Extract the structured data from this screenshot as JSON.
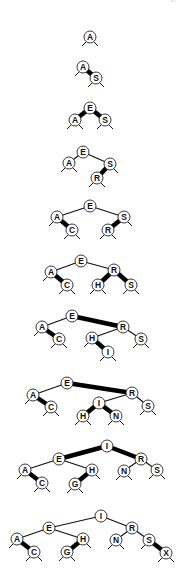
{
  "page_number": "37",
  "style": {
    "node_fill": "#ffffff",
    "node_stroke": "#222222",
    "black_link_color": "#111111",
    "red_link_color": "#000000",
    "black_link_width": 1.2,
    "red_link_width": 4.5,
    "node_radius": 6
  },
  "caption": "Red-black BST construction trace: inserting A S E R C H I N G X",
  "trees": [
    {
      "step": 1,
      "inserted": "A",
      "nodes": [
        {
          "k": "A",
          "x": 90,
          "y": 37
        }
      ],
      "links": []
    },
    {
      "step": 2,
      "inserted": "S",
      "nodes": [
        {
          "k": "A",
          "x": 83,
          "y": 67
        },
        {
          "k": "S",
          "x": 96,
          "y": 78
        }
      ],
      "links": [
        {
          "from": "A",
          "to": "S",
          "red": true
        }
      ]
    },
    {
      "step": 3,
      "inserted": "E",
      "nodes": [
        {
          "k": "E",
          "x": 90,
          "y": 108
        },
        {
          "k": "A",
          "x": 75,
          "y": 120
        },
        {
          "k": "S",
          "x": 105,
          "y": 120
        }
      ],
      "links": [
        {
          "from": "E",
          "to": "A",
          "red": true
        },
        {
          "from": "E",
          "to": "S",
          "red": true
        }
      ]
    },
    {
      "step": 4,
      "inserted": "R",
      "nodes": [
        {
          "k": "E",
          "x": 83,
          "y": 152
        },
        {
          "k": "A",
          "x": 69,
          "y": 163
        },
        {
          "k": "S",
          "x": 110,
          "y": 164
        },
        {
          "k": "R",
          "x": 97,
          "y": 178
        }
      ],
      "links": [
        {
          "from": "E",
          "to": "A",
          "red": false
        },
        {
          "from": "E",
          "to": "S",
          "red": false
        },
        {
          "from": "S",
          "to": "R",
          "red": true
        }
      ]
    },
    {
      "step": 5,
      "inserted": "C",
      "nodes": [
        {
          "k": "E",
          "x": 90,
          "y": 206
        },
        {
          "k": "A",
          "x": 57,
          "y": 217
        },
        {
          "k": "C",
          "x": 72,
          "y": 230
        },
        {
          "k": "S",
          "x": 124,
          "y": 217
        },
        {
          "k": "R",
          "x": 108,
          "y": 230
        }
      ],
      "links": [
        {
          "from": "E",
          "to": "A",
          "red": false
        },
        {
          "from": "E",
          "to": "S",
          "red": false
        },
        {
          "from": "A",
          "to": "C",
          "red": true
        },
        {
          "from": "S",
          "to": "R",
          "red": true
        }
      ]
    },
    {
      "step": 6,
      "inserted": "H",
      "nodes": [
        {
          "k": "E",
          "x": 81,
          "y": 261
        },
        {
          "k": "A",
          "x": 51,
          "y": 272
        },
        {
          "k": "C",
          "x": 67,
          "y": 285
        },
        {
          "k": "R",
          "x": 114,
          "y": 270
        },
        {
          "k": "H",
          "x": 98,
          "y": 285
        },
        {
          "k": "S",
          "x": 131,
          "y": 285
        }
      ],
      "links": [
        {
          "from": "E",
          "to": "A",
          "red": false
        },
        {
          "from": "E",
          "to": "R",
          "red": false
        },
        {
          "from": "A",
          "to": "C",
          "red": true
        },
        {
          "from": "R",
          "to": "H",
          "red": true
        },
        {
          "from": "R",
          "to": "S",
          "red": true
        }
      ]
    },
    {
      "step": 7,
      "inserted": "I",
      "nodes": [
        {
          "k": "E",
          "x": 72,
          "y": 316
        },
        {
          "k": "A",
          "x": 42,
          "y": 327
        },
        {
          "k": "C",
          "x": 59,
          "y": 339
        },
        {
          "k": "R",
          "x": 123,
          "y": 327
        },
        {
          "k": "H",
          "x": 92,
          "y": 338
        },
        {
          "k": "I",
          "x": 108,
          "y": 352
        },
        {
          "k": "S",
          "x": 141,
          "y": 339
        }
      ],
      "links": [
        {
          "from": "E",
          "to": "A",
          "red": false
        },
        {
          "from": "E",
          "to": "R",
          "red": true
        },
        {
          "from": "A",
          "to": "C",
          "red": true
        },
        {
          "from": "R",
          "to": "H",
          "red": false
        },
        {
          "from": "R",
          "to": "S",
          "red": false
        },
        {
          "from": "H",
          "to": "I",
          "red": true
        }
      ]
    },
    {
      "step": 8,
      "inserted": "N",
      "nodes": [
        {
          "k": "E",
          "x": 67,
          "y": 383
        },
        {
          "k": "A",
          "x": 33,
          "y": 395
        },
        {
          "k": "C",
          "x": 51,
          "y": 407
        },
        {
          "k": "R",
          "x": 132,
          "y": 393
        },
        {
          "k": "I",
          "x": 99,
          "y": 403
        },
        {
          "k": "H",
          "x": 83,
          "y": 416
        },
        {
          "k": "N",
          "x": 116,
          "y": 416
        },
        {
          "k": "S",
          "x": 148,
          "y": 406
        }
      ],
      "links": [
        {
          "from": "E",
          "to": "A",
          "red": false
        },
        {
          "from": "E",
          "to": "R",
          "red": true
        },
        {
          "from": "A",
          "to": "C",
          "red": true
        },
        {
          "from": "R",
          "to": "I",
          "red": false
        },
        {
          "from": "R",
          "to": "S",
          "red": false
        },
        {
          "from": "I",
          "to": "H",
          "red": true
        },
        {
          "from": "I",
          "to": "N",
          "red": true
        }
      ]
    },
    {
      "step": 9,
      "inserted": "G",
      "nodes": [
        {
          "k": "I",
          "x": 107,
          "y": 446
        },
        {
          "k": "E",
          "x": 59,
          "y": 459
        },
        {
          "k": "A",
          "x": 25,
          "y": 470
        },
        {
          "k": "C",
          "x": 42,
          "y": 483
        },
        {
          "k": "H",
          "x": 92,
          "y": 470
        },
        {
          "k": "G",
          "x": 75,
          "y": 484
        },
        {
          "k": "R",
          "x": 141,
          "y": 459
        },
        {
          "k": "N",
          "x": 124,
          "y": 471
        },
        {
          "k": "S",
          "x": 157,
          "y": 470
        }
      ],
      "links": [
        {
          "from": "I",
          "to": "E",
          "red": true
        },
        {
          "from": "I",
          "to": "R",
          "red": true
        },
        {
          "from": "E",
          "to": "A",
          "red": false
        },
        {
          "from": "E",
          "to": "H",
          "red": false
        },
        {
          "from": "A",
          "to": "C",
          "red": true
        },
        {
          "from": "H",
          "to": "G",
          "red": true
        },
        {
          "from": "R",
          "to": "N",
          "red": false
        },
        {
          "from": "R",
          "to": "S",
          "red": false
        }
      ]
    },
    {
      "step": 10,
      "inserted": "X",
      "nodes": [
        {
          "k": "I",
          "x": 101,
          "y": 516
        },
        {
          "k": "E",
          "x": 49,
          "y": 528
        },
        {
          "k": "A",
          "x": 17,
          "y": 539
        },
        {
          "k": "C",
          "x": 34,
          "y": 552
        },
        {
          "k": "H",
          "x": 83,
          "y": 539
        },
        {
          "k": "G",
          "x": 67,
          "y": 552
        },
        {
          "k": "R",
          "x": 132,
          "y": 528
        },
        {
          "k": "N",
          "x": 116,
          "y": 540
        },
        {
          "k": "S",
          "x": 149,
          "y": 540
        },
        {
          "k": "X",
          "x": 166,
          "y": 553
        }
      ],
      "links": [
        {
          "from": "I",
          "to": "E",
          "red": false
        },
        {
          "from": "I",
          "to": "R",
          "red": false
        },
        {
          "from": "E",
          "to": "A",
          "red": false
        },
        {
          "from": "E",
          "to": "H",
          "red": false
        },
        {
          "from": "A",
          "to": "C",
          "red": true
        },
        {
          "from": "H",
          "to": "G",
          "red": true
        },
        {
          "from": "R",
          "to": "N",
          "red": false
        },
        {
          "from": "R",
          "to": "S",
          "red": false
        },
        {
          "from": "S",
          "to": "X",
          "red": true
        }
      ]
    }
  ]
}
